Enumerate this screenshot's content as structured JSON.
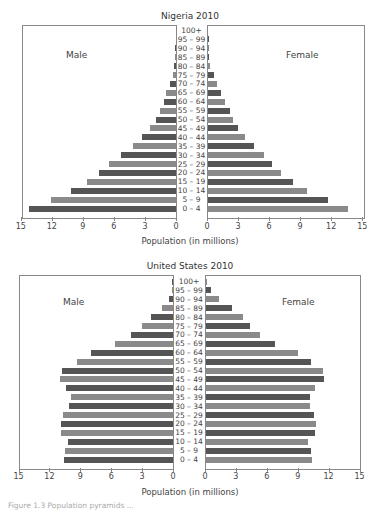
{
  "chart_data": [
    {
      "type": "bar",
      "subtype": "population-pyramid",
      "title": "Nigeria 2010",
      "xlabel": "Population (in millions)",
      "ylabel": "",
      "left_label": "Male",
      "right_label": "Female",
      "xlim": [
        0,
        15
      ],
      "x_ticks": [
        15,
        12,
        9,
        6,
        3,
        0,
        0,
        3,
        6,
        9,
        12,
        15
      ],
      "categories": [
        "100+",
        "95 – 99",
        "90 – 94",
        "85 – 89",
        "80 – 84",
        "75 – 79",
        "70 – 74",
        "65 – 69",
        "60 – 64",
        "55 – 59",
        "50 – 54",
        "45 – 49",
        "40 – 44",
        "35 – 39",
        "30 – 34",
        "25 – 29",
        "20 – 24",
        "15 – 19",
        "10 – 14",
        "5 – 9",
        "0 – 4"
      ],
      "series": [
        {
          "name": "Male",
          "values": [
            0,
            0,
            0.03,
            0.05,
            0.15,
            0.3,
            0.6,
            0.95,
            1.2,
            1.5,
            1.9,
            2.5,
            3.3,
            4.2,
            5.3,
            6.5,
            7.4,
            8.6,
            10.1,
            12.1,
            14.2
          ]
        },
        {
          "name": "Female",
          "values": [
            0,
            0.02,
            0.03,
            0.12,
            0.2,
            0.55,
            0.85,
            1.25,
            1.6,
            2.1,
            2.4,
            2.9,
            3.6,
            4.4,
            5.4,
            6.2,
            7.1,
            8.2,
            9.6,
            11.6,
            13.5
          ]
        }
      ],
      "grid": false,
      "legend": "side labels"
    },
    {
      "type": "bar",
      "subtype": "population-pyramid",
      "title": "United States 2010",
      "xlabel": "Population (in millions)",
      "ylabel": "",
      "left_label": "Male",
      "right_label": "Female",
      "xlim": [
        0,
        15
      ],
      "x_ticks": [
        15,
        12,
        9,
        6,
        3,
        0,
        0,
        3,
        6,
        9,
        12,
        15
      ],
      "categories": [
        "100+",
        "95 – 99",
        "90 – 94",
        "85 – 89",
        "80 – 84",
        "75 – 79",
        "70 – 74",
        "65 – 69",
        "60 – 64",
        "55 – 59",
        "50 – 54",
        "45 – 49",
        "40 – 44",
        "35 – 39",
        "30 – 34",
        "25 – 29",
        "20 – 24",
        "15 – 19",
        "10 – 14",
        "5 – 9",
        "0 – 4"
      ],
      "series": [
        {
          "name": "Male",
          "values": [
            0.02,
            0.1,
            0.4,
            1.1,
            2.1,
            3.0,
            4.1,
            5.6,
            8.0,
            9.3,
            10.8,
            11.0,
            10.4,
            9.9,
            10.1,
            10.7,
            10.9,
            10.9,
            10.2,
            10.5,
            10.6
          ]
        },
        {
          "name": "Female",
          "values": [
            0.07,
            0.45,
            1.3,
            2.5,
            3.6,
            4.3,
            5.2,
            6.7,
            8.9,
            10.2,
            11.4,
            11.5,
            10.6,
            10.1,
            10.1,
            10.5,
            10.7,
            10.6,
            9.9,
            10.2,
            10.3
          ]
        }
      ],
      "grid": false,
      "legend": "side labels"
    }
  ],
  "colors": {
    "bar_dark": "#555555",
    "bar_light": "#8a8a8a",
    "frame": "#888888"
  },
  "caption": "Figure 1.3 Population pyramids ..."
}
